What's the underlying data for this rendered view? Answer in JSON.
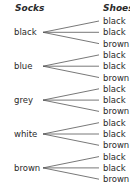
{
  "headers": {
    "socks": "Socks",
    "shoes": "Shoes"
  },
  "socks": [
    {
      "label": "black",
      "shoes": [
        "black",
        "black",
        "brown"
      ]
    },
    {
      "label": "blue",
      "shoes": [
        "black",
        "black",
        "brown"
      ]
    },
    {
      "label": "grey",
      "shoes": [
        "black",
        "black",
        "brown"
      ]
    },
    {
      "label": "white",
      "shoes": [
        "black",
        "black",
        "brown"
      ]
    },
    {
      "label": "brown",
      "shoes": [
        "black",
        "black",
        "brown"
      ]
    }
  ],
  "colors": {
    "line": "#555555",
    "text": "#2a2a2a"
  }
}
